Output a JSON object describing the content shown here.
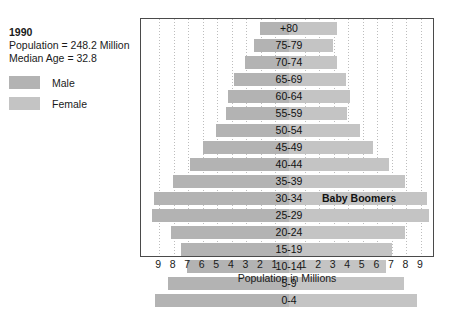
{
  "info": {
    "year": "1990",
    "population_line": "Population = 248.2 Million",
    "median_age_line": "Median Age = 32.8"
  },
  "legend": {
    "male_label": "Male",
    "female_label": "Female",
    "male_color": "#b3b3b3",
    "female_color": "#c4c4c4"
  },
  "annotation": {
    "text": "Baby Boomers",
    "age_group": "30-34"
  },
  "axis": {
    "title": "Population in Millions",
    "left_ticks": [
      "9",
      "8",
      "7",
      "6",
      "5",
      "4",
      "3",
      "2",
      "1"
    ],
    "right_ticks": [
      "1",
      "2",
      "3",
      "4",
      "5",
      "6",
      "7",
      "8",
      "9"
    ]
  },
  "chart_data": {
    "type": "bar",
    "subtitle": "Population = 248.2 Million, Median Age = 32.8",
    "orientation": "horizontal-diverging",
    "xlabel": "Population in Millions",
    "ylabel": "Age Group",
    "xlim": [
      -10,
      10
    ],
    "grid": true,
    "legend_position": "top-left",
    "categories": [
      "+80",
      "75-79",
      "70-74",
      "65-69",
      "60-64",
      "55-59",
      "50-54",
      "45-49",
      "40-44",
      "35-39",
      "30-34",
      "25-29",
      "20-24",
      "15-19",
      "10-14",
      "5-9",
      "0-4"
    ],
    "series": [
      {
        "name": "Male",
        "color": "#b3b3b3",
        "values": [
          2.0,
          2.4,
          3.0,
          3.8,
          4.2,
          4.3,
          5.0,
          5.9,
          6.8,
          8.0,
          9.3,
          9.4,
          8.1,
          7.4,
          7.0,
          8.3,
          9.2
        ]
      },
      {
        "name": "Female",
        "color": "#c4c4c4",
        "values": [
          3.3,
          3.0,
          3.3,
          3.9,
          4.2,
          4.0,
          4.9,
          5.8,
          6.9,
          8.0,
          9.5,
          9.6,
          8.0,
          7.1,
          6.7,
          7.9,
          8.8
        ]
      }
    ]
  }
}
